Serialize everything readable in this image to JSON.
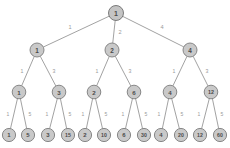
{
  "diagram": {
    "type": "tree",
    "levels": 4,
    "colors": {
      "node_fill": "#c9c9c9",
      "node_stroke": "#7d7d7d",
      "edge_stroke": "#8a8a8a",
      "node_label": "#4a4a4a",
      "edge_label": "#9a9a9a",
      "background": "#ffffff"
    },
    "nodes": [
      {
        "id": "n0",
        "label": "1",
        "x": 116,
        "y": 13,
        "r": 7.5,
        "level": 0,
        "font_size": 7.0
      },
      {
        "id": "n1",
        "label": "1",
        "x": 37,
        "y": 50,
        "r": 7.0,
        "level": 1,
        "font_size": 6.4
      },
      {
        "id": "n2",
        "label": "2",
        "x": 112,
        "y": 50,
        "r": 7.0,
        "level": 1,
        "font_size": 6.4
      },
      {
        "id": "n4",
        "label": "4",
        "x": 190,
        "y": 50,
        "r": 7.0,
        "level": 1,
        "font_size": 6.4
      },
      {
        "id": "n1-1",
        "label": "1",
        "x": 19,
        "y": 92,
        "r": 6.8,
        "level": 2,
        "font_size": 6.2
      },
      {
        "id": "n1-3",
        "label": "3",
        "x": 59,
        "y": 92,
        "r": 6.8,
        "level": 2,
        "font_size": 6.2
      },
      {
        "id": "n2-2",
        "label": "2",
        "x": 94,
        "y": 92,
        "r": 6.8,
        "level": 2,
        "font_size": 6.2
      },
      {
        "id": "n2-6",
        "label": "6",
        "x": 134,
        "y": 92,
        "r": 6.8,
        "level": 2,
        "font_size": 6.2
      },
      {
        "id": "n4-4",
        "label": "4",
        "x": 170,
        "y": 92,
        "r": 6.8,
        "level": 2,
        "font_size": 6.2
      },
      {
        "id": "n4-12",
        "label": "12",
        "x": 211,
        "y": 92,
        "r": 6.8,
        "level": 2,
        "font_size": 5.4
      },
      {
        "id": "n1-1-1",
        "label": "1",
        "x": 9,
        "y": 135,
        "r": 6.6,
        "level": 3,
        "font_size": 6.0
      },
      {
        "id": "n1-1-5",
        "label": "5",
        "x": 28,
        "y": 135,
        "r": 6.6,
        "level": 3,
        "font_size": 6.0
      },
      {
        "id": "n1-3-3",
        "label": "3",
        "x": 48,
        "y": 135,
        "r": 6.6,
        "level": 3,
        "font_size": 6.0
      },
      {
        "id": "n1-3-15",
        "label": "15",
        "x": 68,
        "y": 135,
        "r": 6.6,
        "level": 3,
        "font_size": 5.2
      },
      {
        "id": "n2-2-2",
        "label": "2",
        "x": 85,
        "y": 135,
        "r": 6.6,
        "level": 3,
        "font_size": 6.0
      },
      {
        "id": "n2-2-10",
        "label": "10",
        "x": 104,
        "y": 135,
        "r": 6.6,
        "level": 3,
        "font_size": 5.2
      },
      {
        "id": "n2-6-6",
        "label": "6",
        "x": 124,
        "y": 135,
        "r": 6.6,
        "level": 3,
        "font_size": 6.0
      },
      {
        "id": "n2-6-30",
        "label": "30",
        "x": 144,
        "y": 135,
        "r": 6.6,
        "level": 3,
        "font_size": 5.2
      },
      {
        "id": "n4-4-4",
        "label": "4",
        "x": 161,
        "y": 135,
        "r": 6.6,
        "level": 3,
        "font_size": 6.0
      },
      {
        "id": "n4-4-20",
        "label": "20",
        "x": 181,
        "y": 135,
        "r": 6.6,
        "level": 3,
        "font_size": 5.2
      },
      {
        "id": "n4-12-12",
        "label": "12",
        "x": 200,
        "y": 135,
        "r": 6.6,
        "level": 3,
        "font_size": 5.2
      },
      {
        "id": "n4-12-60",
        "label": "60",
        "x": 220,
        "y": 135,
        "r": 6.6,
        "level": 3,
        "font_size": 5.2
      }
    ],
    "edges": [
      {
        "id": "e0-1",
        "from": "n0",
        "to": "n1",
        "label": "1",
        "lx": 70,
        "ly": 27,
        "font_size": 5.6
      },
      {
        "id": "e0-2",
        "from": "n0",
        "to": "n2",
        "label": "2",
        "lx": 120,
        "ly": 32,
        "font_size": 5.6
      },
      {
        "id": "e0-4",
        "from": "n0",
        "to": "n4",
        "label": "4",
        "lx": 162,
        "ly": 27,
        "font_size": 5.6
      },
      {
        "id": "e1-1",
        "from": "n1",
        "to": "n1-1",
        "label": "1",
        "lx": 22,
        "ly": 71,
        "font_size": 5.2
      },
      {
        "id": "e1-3",
        "from": "n1",
        "to": "n1-3",
        "label": "3",
        "lx": 54,
        "ly": 71,
        "font_size": 5.2
      },
      {
        "id": "e2-1",
        "from": "n2",
        "to": "n2-2",
        "label": "1",
        "lx": 97,
        "ly": 71,
        "font_size": 5.2
      },
      {
        "id": "e2-3",
        "from": "n2",
        "to": "n2-6",
        "label": "3",
        "lx": 130,
        "ly": 71,
        "font_size": 5.2
      },
      {
        "id": "e4-1",
        "from": "n4",
        "to": "n4-4",
        "label": "1",
        "lx": 174,
        "ly": 71,
        "font_size": 5.2
      },
      {
        "id": "e4-3",
        "from": "n4",
        "to": "n4-12",
        "label": "3",
        "lx": 207,
        "ly": 71,
        "font_size": 5.2
      },
      {
        "id": "e11-1",
        "from": "n1-1",
        "to": "n1-1-1",
        "label": "1",
        "lx": 8,
        "ly": 114,
        "font_size": 5.0
      },
      {
        "id": "e11-5",
        "from": "n1-1",
        "to": "n1-1-5",
        "label": "5",
        "lx": 30,
        "ly": 114,
        "font_size": 5.0
      },
      {
        "id": "e13-1",
        "from": "n1-3",
        "to": "n1-3-3",
        "label": "1",
        "lx": 47,
        "ly": 114,
        "font_size": 5.0
      },
      {
        "id": "e13-5",
        "from": "n1-3",
        "to": "n1-3-15",
        "label": "5",
        "lx": 70,
        "ly": 114,
        "font_size": 5.0
      },
      {
        "id": "e22-1",
        "from": "n2-2",
        "to": "n2-2-2",
        "label": "1",
        "lx": 83,
        "ly": 114,
        "font_size": 5.0
      },
      {
        "id": "e22-5",
        "from": "n2-2",
        "to": "n2-2-10",
        "label": "5",
        "lx": 106,
        "ly": 114,
        "font_size": 5.0
      },
      {
        "id": "e26-1",
        "from": "n2-6",
        "to": "n2-6-6",
        "label": "1",
        "lx": 123,
        "ly": 114,
        "font_size": 5.0
      },
      {
        "id": "e26-5",
        "from": "n2-6",
        "to": "n2-6-30",
        "label": "5",
        "lx": 146,
        "ly": 114,
        "font_size": 5.0
      },
      {
        "id": "e44-1",
        "from": "n4-4",
        "to": "n4-4-4",
        "label": "1",
        "lx": 159,
        "ly": 114,
        "font_size": 5.0
      },
      {
        "id": "e44-5",
        "from": "n4-4",
        "to": "n4-4-20",
        "label": "5",
        "lx": 182,
        "ly": 114,
        "font_size": 5.0
      },
      {
        "id": "e412-1",
        "from": "n4-12",
        "to": "n4-12-12",
        "label": "1",
        "lx": 199,
        "ly": 114,
        "font_size": 5.0
      },
      {
        "id": "e412-5",
        "from": "n4-12",
        "to": "n4-12-60",
        "label": "5",
        "lx": 222,
        "ly": 114,
        "font_size": 5.0
      }
    ]
  }
}
